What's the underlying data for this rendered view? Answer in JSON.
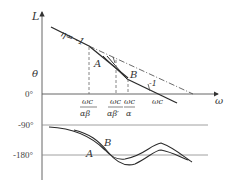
{
  "diagram": {
    "type": "bode-plot-schematic",
    "colors": {
      "curve": "#2a2a2a",
      "axis": "#555555",
      "grid": "#888888",
      "text": "#333333"
    },
    "magnitude_plot": {
      "y_axis_label": "L",
      "x_axis_label": "ω",
      "y_tick_label": "θ",
      "zero_label": "0°",
      "slope_label_main": "η= -1",
      "slope_label_tail": "-1",
      "point_a": "A",
      "point_b": "B",
      "x_ticks": [
        {
          "num": "ωc",
          "den": "αβ"
        },
        {
          "num": "ωc",
          "den": "αβ′"
        },
        {
          "num": "ωc",
          "den": "α"
        },
        {
          "num": "ωc",
          "den": ""
        }
      ]
    },
    "phase_plot": {
      "tick_labels": [
        "-90°",
        "-180°"
      ],
      "curve_a_label": "A",
      "curve_b_label": "B"
    }
  }
}
